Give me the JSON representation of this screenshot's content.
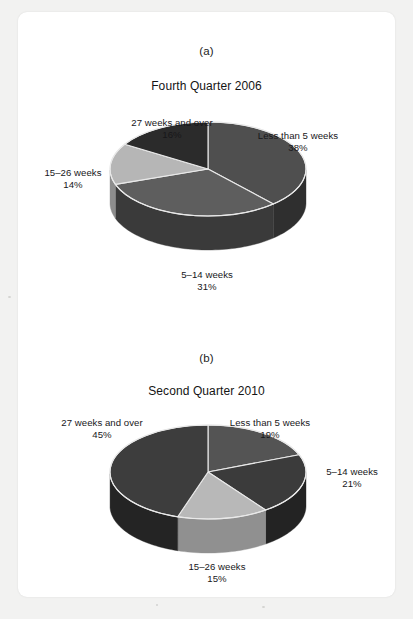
{
  "figure": {
    "background_color": "#f2f2f1",
    "card_color": "#ffffff"
  },
  "panels": [
    {
      "letter": "(a)",
      "title": "Fourth Quarter 2006",
      "labels": {
        "less_than_5": {
          "name": "Less than 5 weeks",
          "pct": "38%"
        },
        "w5_14": {
          "name": "5–14 weeks",
          "pct": "31%"
        },
        "w15_26": {
          "name": "15–26 weeks",
          "pct": "14%"
        },
        "w27_over": {
          "name": "27 weeks and over",
          "pct": "16%"
        }
      }
    },
    {
      "letter": "(b)",
      "title": "Second Quarter 2010",
      "labels": {
        "less_than_5": {
          "name": "Less than 5 weeks",
          "pct": "19%"
        },
        "w5_14": {
          "name": "5–14 weeks",
          "pct": "21%"
        },
        "w15_26": {
          "name": "15–26 weeks",
          "pct": "15%"
        },
        "w27_over": {
          "name": "27 weeks and over",
          "pct": "45%"
        }
      }
    }
  ],
  "chart_data": [
    {
      "type": "pie",
      "title": "Fourth Quarter 2006",
      "subtitle": "(a)",
      "categories": [
        "Less than 5 weeks",
        "5–14 weeks",
        "15–26 weeks",
        "27 weeks and over"
      ],
      "values": [
        38,
        31,
        14,
        16
      ],
      "value_labels": [
        "38%",
        "31%",
        "14%",
        "16%"
      ],
      "units": "percent",
      "colors": [
        "#4f4f4f",
        "#5e5e5e",
        "#b6b6b6",
        "#2b2b2b"
      ],
      "side_colors": [
        "#2f2f2f",
        "#3a3a3a",
        "#8d8d8d",
        "#1a1a1a"
      ],
      "start_angle_deg": -90,
      "direction": "clockwise",
      "three_d": true,
      "legend": "none",
      "labels_position": "outside"
    },
    {
      "type": "pie",
      "title": "Second Quarter 2010",
      "subtitle": "(b)",
      "categories": [
        "Less than 5 weeks",
        "5–14 weeks",
        "15–26 weeks",
        "27 weeks and over"
      ],
      "values": [
        19,
        21,
        15,
        45
      ],
      "value_labels": [
        "19%",
        "21%",
        "15%",
        "45%"
      ],
      "units": "percent",
      "colors": [
        "#545454",
        "#3b3b3b",
        "#b8b8b8",
        "#3d3d3d"
      ],
      "side_colors": [
        "#343434",
        "#232323",
        "#909090",
        "#242424"
      ],
      "start_angle_deg": -90,
      "direction": "clockwise",
      "three_d": true,
      "legend": "none",
      "labels_position": "outside"
    }
  ]
}
